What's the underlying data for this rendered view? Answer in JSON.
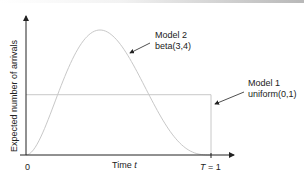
{
  "chart_data": {
    "type": "line",
    "title": "",
    "xlabel": "Time t",
    "xlabel_parts": [
      "Time ",
      "t"
    ],
    "ylabel": "Expected number of arrivals",
    "xlim": [
      0,
      1
    ],
    "x_ticks": [
      {
        "value": 0,
        "label": "0"
      },
      {
        "value": 1,
        "label_parts": [
          "T",
          " = 1"
        ]
      }
    ],
    "grid": false,
    "series": [
      {
        "name": "Model 2 beta(3,4)",
        "kind": "beta",
        "params": [
          3,
          4
        ],
        "color": "#c8c8c8",
        "annotation": {
          "lines": [
            "Model 2",
            "beta(3,4)"
          ]
        }
      },
      {
        "name": "Model 1 uniform(0,1)",
        "kind": "uniform",
        "params": [
          0,
          1
        ],
        "color": "#c8c8c8",
        "annotation": {
          "lines": [
            "Model 1",
            "uniform(0,1)"
          ]
        }
      }
    ],
    "axis_color": "#222222"
  }
}
